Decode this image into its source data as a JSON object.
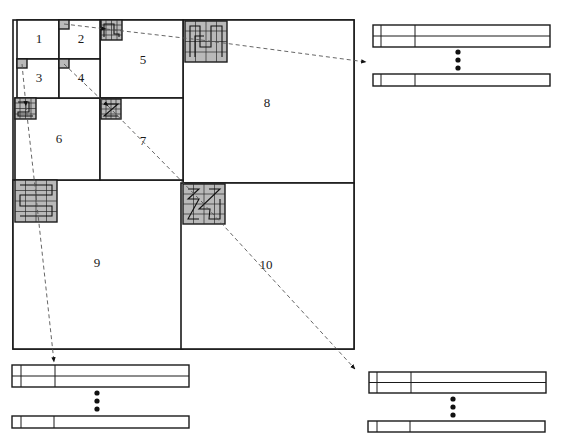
{
  "diagram": {
    "type": "quadtree-block-layout",
    "blocks": [
      {
        "id": "1",
        "label": "1"
      },
      {
        "id": "2",
        "label": "2"
      },
      {
        "id": "3",
        "label": "3"
      },
      {
        "id": "4",
        "label": "4"
      },
      {
        "id": "5",
        "label": "5"
      },
      {
        "id": "6",
        "label": "6"
      },
      {
        "id": "7",
        "label": "7"
      },
      {
        "id": "8",
        "label": "8"
      },
      {
        "id": "9",
        "label": "9"
      },
      {
        "id": "10",
        "label": "10"
      }
    ],
    "patches": [
      {
        "block": "2",
        "grid": 1,
        "curve": "none"
      },
      {
        "block": "3",
        "grid": 1,
        "curve": "none"
      },
      {
        "block": "4",
        "grid": 1,
        "curve": "none"
      },
      {
        "block": "5",
        "grid": 2,
        "curve": "hilbert"
      },
      {
        "block": "6",
        "grid": 2,
        "curve": "hilbert"
      },
      {
        "block": "7",
        "grid": 2,
        "curve": "z-order"
      },
      {
        "block": "8",
        "grid": 4,
        "curve": "hilbert"
      },
      {
        "block": "9",
        "grid": 4,
        "curve": "snake"
      },
      {
        "block": "10",
        "grid": 4,
        "curve": "diagonal-z"
      }
    ],
    "arrows": [
      {
        "from": "2",
        "to": "5"
      },
      {
        "from": "5",
        "to": "8"
      },
      {
        "from": "8",
        "to": "table-top-right"
      },
      {
        "from": "4",
        "to": "7"
      },
      {
        "from": "7",
        "to": "10"
      },
      {
        "from": "10",
        "to": "table-bottom-right"
      },
      {
        "from": "3",
        "to": "6"
      },
      {
        "from": "6",
        "to": "9"
      },
      {
        "from": "9",
        "to": "table-bottom-left"
      }
    ],
    "tables": [
      {
        "id": "table-top-right",
        "rows_top": 2,
        "ellipsis": "⋮",
        "rows_bottom": 1,
        "columns": 3
      },
      {
        "id": "table-bottom-left",
        "rows_top": 2,
        "ellipsis": "⋮",
        "rows_bottom": 1,
        "columns": 3
      },
      {
        "id": "table-bottom-right",
        "rows_top": 2,
        "ellipsis": "⋮",
        "rows_bottom": 1,
        "columns": 3
      }
    ]
  }
}
